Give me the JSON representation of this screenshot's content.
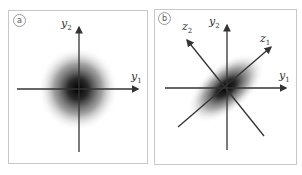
{
  "panels": [
    {
      "id": "a",
      "badge": "a",
      "axes": {
        "y1_label": "y",
        "y1_sub": "1",
        "y2_label": "y",
        "y2_sub": "2"
      },
      "distribution": "isotropic gaussian blob centered at origin"
    },
    {
      "id": "b",
      "badge": "b",
      "axes": {
        "y1_label": "y",
        "y1_sub": "1",
        "y2_label": "y",
        "y2_sub": "2",
        "z1_label": "z",
        "z1_sub": "1",
        "z2_label": "z",
        "z2_sub": "2"
      },
      "distribution": "elongated gaussian blob along z1 diagonal"
    }
  ],
  "colors": {
    "frame": "#c8c8c8",
    "axis": "#333333",
    "blob": "#000000"
  }
}
